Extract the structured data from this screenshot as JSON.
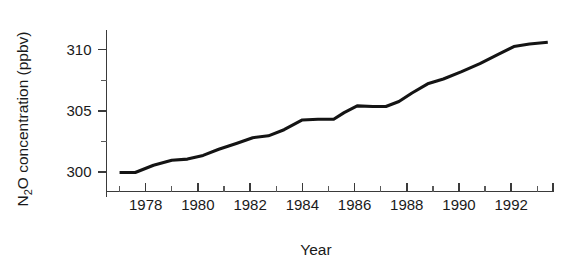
{
  "chart_data": {
    "type": "line",
    "title": "",
    "xlabel": "Year",
    "ylabel": "N2O concentration (ppbv)",
    "ylabel_parts": {
      "pre": "N",
      "sub": "2",
      "post": "O concentration (ppbv)"
    },
    "xlim": [
      1976.5,
      1993.6
    ],
    "ylim": [
      298.4,
      311.6
    ],
    "grid": false,
    "legend": null,
    "x_tick_labels": [
      "1978",
      "1980",
      "1982",
      "1984",
      "1986",
      "1988",
      "1990",
      "1992"
    ],
    "x_tick_values": [
      1978,
      1980,
      1982,
      1984,
      1986,
      1988,
      1990,
      1992
    ],
    "x_minor_ticks": [
      1977,
      1979,
      1981,
      1983,
      1985,
      1987,
      1989,
      1991,
      1993
    ],
    "y_tick_labels": [
      "300",
      "305",
      "310"
    ],
    "y_tick_values": [
      300,
      305,
      310
    ],
    "y_minor_ticks": [
      302.5,
      307.5
    ],
    "line_color": "#141414",
    "axis_color": "#3a3a3a",
    "x": [
      1977.0,
      1977.6,
      1978.3,
      1979.0,
      1979.6,
      1980.2,
      1980.8,
      1981.5,
      1982.1,
      1982.7,
      1983.3,
      1984.0,
      1984.6,
      1985.2,
      1985.6,
      1986.1,
      1986.7,
      1987.2,
      1987.7,
      1988.2,
      1988.8,
      1989.4,
      1990.1,
      1990.8,
      1991.5,
      1992.1,
      1992.7,
      1993.4
    ],
    "values": [
      299.95,
      299.95,
      300.55,
      300.95,
      301.05,
      301.35,
      301.85,
      302.35,
      302.8,
      302.95,
      303.45,
      304.25,
      304.3,
      304.3,
      304.85,
      305.4,
      305.35,
      305.35,
      305.75,
      306.45,
      307.2,
      307.6,
      308.2,
      308.85,
      309.6,
      310.25,
      310.45,
      310.6
    ]
  }
}
